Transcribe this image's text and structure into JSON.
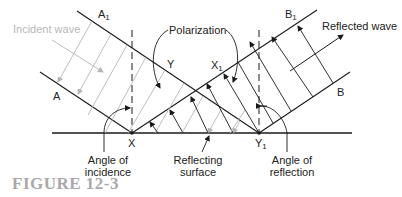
{
  "labels": {
    "incident_wave": "Incident wave",
    "reflected_wave": "Reflected wave",
    "polarization": "Polarization",
    "A": "A",
    "A1_base": "A",
    "A1_sub": "1",
    "B": "B",
    "B1_base": "B",
    "B1_sub": "1",
    "X": "X",
    "X1_base": "X",
    "X1_sub": "1",
    "Y": "Y",
    "Y1_base": "Y",
    "Y1_sub": "1",
    "angle_incidence_line1": "Angle of",
    "angle_incidence_line2": "incidence",
    "reflecting_surface_line1": "Reflecting",
    "reflecting_surface_line2": "surface",
    "angle_reflection_line1": "Angle of",
    "angle_reflection_line2": "reflection"
  },
  "caption": "FIGURE 12-3",
  "colors": {
    "line": "#1a1a1a",
    "incident_gray": "#b5b5b5",
    "caption": "#a9a9a9"
  }
}
